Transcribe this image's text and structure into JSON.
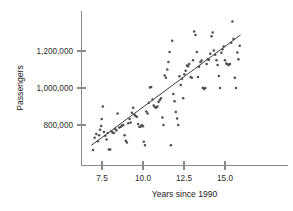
{
  "chart_data": {
    "type": "scatter",
    "title": "",
    "xlabel": "Years since 1990",
    "ylabel": "Passengers",
    "xlim": [
      6.6,
      16.2
    ],
    "ylim": [
      640000,
      1420000
    ],
    "grid": false,
    "legend": null,
    "xticks": [
      7.5,
      10.0,
      12.5,
      15.0
    ],
    "xtick_labels": [
      "7.5",
      "10.0",
      "12.5",
      "15.0"
    ],
    "yticks": [
      800000,
      1000000,
      1200000
    ],
    "ytick_labels": [
      "800,000",
      "1,000,000",
      "1,200,000"
    ],
    "point_color": "#4d4d4d",
    "line_color": "#3d3d3d",
    "axis_color": "#8a8a8a",
    "trendline": {
      "type": "linear-fit",
      "x_start": 6.85,
      "y_start": 690000,
      "x_end": 15.95,
      "y_end": 1287000,
      "slope": 65600,
      "intercept": 240600
    },
    "series": [
      {
        "name": "Passengers",
        "marker": "circle",
        "points": [
          [
            6.95,
            665000
          ],
          [
            7.05,
            731000
          ],
          [
            7.15,
            752000
          ],
          [
            7.25,
            712000
          ],
          [
            7.32,
            745000
          ],
          [
            7.38,
            775000
          ],
          [
            7.45,
            795000
          ],
          [
            7.48,
            833000
          ],
          [
            7.55,
            900000
          ],
          [
            7.62,
            762000
          ],
          [
            7.7,
            742000
          ],
          [
            7.78,
            722000
          ],
          [
            7.85,
            757000
          ],
          [
            7.92,
            668000
          ],
          [
            8.0,
            668000
          ],
          [
            8.08,
            766000
          ],
          [
            8.15,
            760000
          ],
          [
            8.22,
            757000
          ],
          [
            8.3,
            779000
          ],
          [
            8.38,
            770000
          ],
          [
            8.45,
            862000
          ],
          [
            8.55,
            786000
          ],
          [
            8.65,
            790000
          ],
          [
            8.72,
            797000
          ],
          [
            8.8,
            800000
          ],
          [
            8.88,
            745000
          ],
          [
            8.95,
            715000
          ],
          [
            9.02,
            706000
          ],
          [
            9.1,
            810000
          ],
          [
            9.18,
            833000
          ],
          [
            9.25,
            813000
          ],
          [
            9.32,
            866000
          ],
          [
            9.4,
            893000
          ],
          [
            9.48,
            855000
          ],
          [
            9.55,
            848000
          ],
          [
            9.62,
            845000
          ],
          [
            9.7,
            806000
          ],
          [
            9.78,
            790000
          ],
          [
            9.85,
            790000
          ],
          [
            9.92,
            800000
          ],
          [
            10.0,
            793000
          ],
          [
            10.05,
            710000
          ],
          [
            10.12,
            690000
          ],
          [
            10.2,
            873000
          ],
          [
            10.28,
            862000
          ],
          [
            10.35,
            920000
          ],
          [
            10.42,
            1003000
          ],
          [
            10.5,
            1005000
          ],
          [
            10.58,
            938000
          ],
          [
            10.65,
            905000
          ],
          [
            10.72,
            897000
          ],
          [
            10.8,
            893000
          ],
          [
            10.88,
            900000
          ],
          [
            10.95,
            925000
          ],
          [
            11.02,
            935000
          ],
          [
            11.1,
            945000
          ],
          [
            11.18,
            841000
          ],
          [
            11.25,
            800000
          ],
          [
            11.32,
            1068000
          ],
          [
            11.4,
            1055000
          ],
          [
            11.48,
            1100000
          ],
          [
            11.55,
            1140000
          ],
          [
            11.62,
            1195000
          ],
          [
            11.7,
            690000
          ],
          [
            11.78,
            1255000
          ],
          [
            11.85,
            968000
          ],
          [
            11.92,
            928000
          ],
          [
            12.0,
            870000
          ],
          [
            12.08,
            835000
          ],
          [
            12.15,
            800000
          ],
          [
            12.22,
            1063000
          ],
          [
            12.3,
            1016000
          ],
          [
            12.38,
            1050000
          ],
          [
            12.45,
            945000
          ],
          [
            12.52,
            1075000
          ],
          [
            12.6,
            1093000
          ],
          [
            12.68,
            1122000
          ],
          [
            12.75,
            1118000
          ],
          [
            12.82,
            1130000
          ],
          [
            12.9,
            1060000
          ],
          [
            12.98,
            1055000
          ],
          [
            13.05,
            1150000
          ],
          [
            13.12,
            1305000
          ],
          [
            13.2,
            1287000
          ],
          [
            13.28,
            1195000
          ],
          [
            13.35,
            1060000
          ],
          [
            13.42,
            1115000
          ],
          [
            13.5,
            1140000
          ],
          [
            13.58,
            1148000
          ],
          [
            13.65,
            1002000
          ],
          [
            13.72,
            995000
          ],
          [
            13.8,
            1000000
          ],
          [
            13.88,
            1130000
          ],
          [
            13.95,
            1155000
          ],
          [
            14.02,
            1153000
          ],
          [
            14.1,
            1185000
          ],
          [
            14.18,
            1280000
          ],
          [
            14.25,
            1300000
          ],
          [
            14.32,
            1203000
          ],
          [
            14.4,
            1180000
          ],
          [
            14.48,
            1150000
          ],
          [
            14.55,
            1125000
          ],
          [
            14.62,
            1065000
          ],
          [
            14.7,
            1000000
          ],
          [
            14.78,
            1190000
          ],
          [
            14.85,
            1210000
          ],
          [
            14.92,
            1225000
          ],
          [
            15.0,
            1150000
          ],
          [
            15.08,
            1133000
          ],
          [
            15.15,
            1128000
          ],
          [
            15.22,
            1125000
          ],
          [
            15.3,
            1130000
          ],
          [
            15.38,
            1245000
          ],
          [
            15.45,
            1360000
          ],
          [
            15.52,
            1265000
          ],
          [
            15.6,
            1055000
          ],
          [
            15.68,
            1000000
          ],
          [
            15.75,
            1192000
          ],
          [
            15.82,
            1155000
          ],
          [
            15.9,
            1228000
          ]
        ]
      }
    ]
  }
}
